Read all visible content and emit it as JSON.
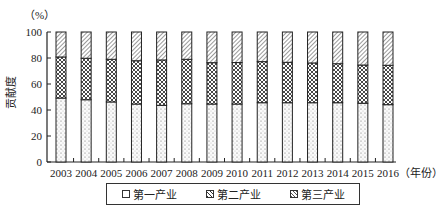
{
  "chart_data": {
    "type": "bar",
    "stacked": true,
    "title": "",
    "xlabel": "（年份）",
    "ylabel": "贡献度",
    "yunit": "（%）",
    "ylim": [
      0,
      100
    ],
    "yticks": [
      0,
      20,
      40,
      60,
      80,
      100
    ],
    "grid": false,
    "legend_position": "bottom",
    "categories": [
      "2003",
      "2004",
      "2005",
      "2006",
      "2007",
      "2008",
      "2009",
      "2010",
      "2011",
      "2012",
      "2013",
      "2014",
      "2015",
      "2016"
    ],
    "series": [
      {
        "name": "第一产业",
        "pattern": "dots",
        "values": [
          49.2,
          47.9,
          46.2,
          44.6,
          43.6,
          44.8,
          44.6,
          44.6,
          45.6,
          45.6,
          45.6,
          45.6,
          45.2,
          44.1
        ]
      },
      {
        "name": "第二产业",
        "pattern": "crosshatch",
        "values": [
          31.6,
          31.9,
          32.8,
          33.3,
          34.9,
          34.2,
          31.8,
          31.9,
          31.6,
          31.1,
          30.6,
          30.0,
          29.4,
          30.3
        ]
      },
      {
        "name": "第三产业",
        "pattern": "diagonal",
        "values": [
          19.2,
          20.2,
          21.0,
          22.1,
          21.5,
          21.0,
          23.6,
          23.5,
          22.8,
          23.3,
          23.8,
          24.4,
          25.4,
          25.6
        ]
      }
    ]
  },
  "legend": {
    "items": [
      {
        "label": "第一产业"
      },
      {
        "label": "第二产业"
      },
      {
        "label": "第三产业"
      }
    ]
  },
  "axis": {
    "y_unit": "（%）",
    "y_title": "贡献度",
    "x_title": "（年份）"
  }
}
